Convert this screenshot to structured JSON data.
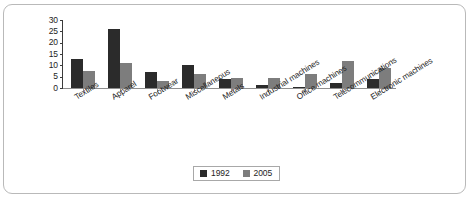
{
  "chart_data": {
    "type": "bar",
    "title": "",
    "subtitle": "",
    "xlabel": "",
    "ylabel": "",
    "ylim": [
      0,
      30
    ],
    "yticks": [
      0,
      5,
      10,
      15,
      20,
      25,
      30
    ],
    "grid": false,
    "legend_position": "bottom-center",
    "categories": [
      "Textiles",
      "Apparel",
      "Footwear",
      "Miscellaneous",
      "Metals",
      "Industrial machines",
      "Office machines",
      "Telecommunications",
      "Electronic machines"
    ],
    "series": [
      {
        "name": "1992",
        "color": "#2b2b2b",
        "values": [
          13,
          26,
          7,
          10,
          4,
          1.5,
          0.5,
          2,
          4
        ]
      },
      {
        "name": "2005",
        "color": "#7d7d7d",
        "values": [
          7.5,
          11,
          3,
          6,
          4.5,
          4.5,
          6,
          12,
          9
        ]
      }
    ]
  },
  "legend": {
    "items": [
      {
        "label": "1992",
        "color": "#2b2b2b"
      },
      {
        "label": "2005",
        "color": "#7d7d7d"
      }
    ]
  }
}
